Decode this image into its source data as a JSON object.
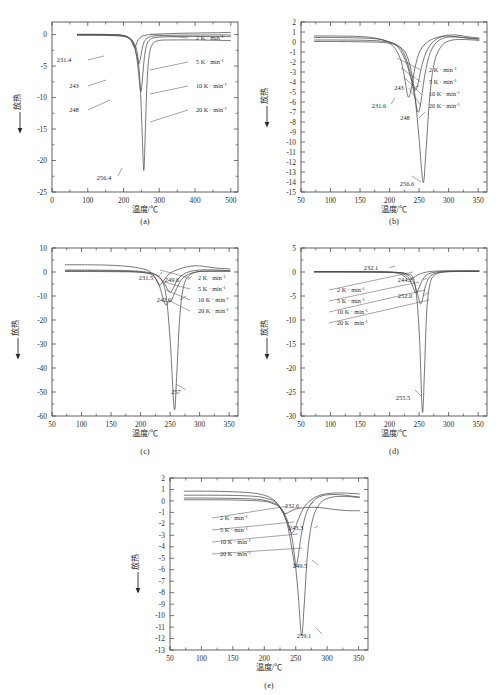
{
  "figure": {
    "axis_x_title": "温度/℃",
    "axis_y_title": "放热",
    "legend_entries": [
      "2 K · min",
      "5 K · min",
      "10 K · min",
      "20 K · min"
    ],
    "legend_exponent": "-1",
    "captions": [
      "(a)",
      "(b)",
      "(c)",
      "(d)",
      "(e)"
    ]
  },
  "chart_data": [
    {
      "type": "line",
      "panel": "(a)",
      "title": "",
      "xlabel": "温度/℃",
      "ylabel": "放热",
      "xlim": [
        0,
        520
      ],
      "ylim": [
        -25,
        2
      ],
      "xticks": [
        0,
        100,
        200,
        300,
        400,
        500
      ],
      "yticks": [
        0,
        -5,
        -10,
        -15,
        -20,
        -25
      ],
      "grid": false,
      "legend_position": "right-inside",
      "annotations": [
        "231.4",
        "243",
        "248",
        "256.4"
      ],
      "series": [
        {
          "name": "2 K · min-1",
          "peak_temperature": 231.4,
          "peak_value": -2.1,
          "x": [
            70,
            120,
            160,
            190,
            210,
            220,
            226,
            231.4,
            236,
            242,
            250,
            260,
            275,
            300,
            340,
            400,
            460,
            500
          ],
          "y": [
            0.05,
            0.05,
            0.02,
            -0.05,
            -0.35,
            -0.9,
            -1.6,
            -2.1,
            -1.5,
            -0.75,
            -0.3,
            -0.12,
            0.0,
            0.1,
            0.18,
            0.25,
            0.3,
            0.35
          ]
        },
        {
          "name": "5 K · min-1",
          "peak_temperature": 243,
          "peak_value": -4.6,
          "x": [
            70,
            120,
            160,
            195,
            215,
            228,
            236,
            240,
            243,
            247,
            252,
            258,
            268,
            285,
            320,
            380,
            450,
            500
          ],
          "y": [
            0.0,
            0.0,
            -0.02,
            -0.1,
            -0.5,
            -1.5,
            -3.2,
            -4.1,
            -4.6,
            -3.9,
            -2.3,
            -1.1,
            -0.5,
            -0.22,
            -0.12,
            -0.08,
            -0.05,
            -0.05
          ]
        },
        {
          "name": "10 K · min-1",
          "peak_temperature": 248,
          "peak_value": -9.1,
          "x": [
            70,
            120,
            160,
            200,
            220,
            232,
            240,
            244,
            248,
            252,
            257,
            263,
            272,
            290,
            330,
            390,
            450,
            500
          ],
          "y": [
            -0.05,
            -0.05,
            -0.08,
            -0.2,
            -0.7,
            -2.1,
            -5.0,
            -7.3,
            -9.1,
            -7.6,
            -4.3,
            -2.0,
            -0.9,
            -0.45,
            -0.35,
            -0.3,
            -0.3,
            -0.3
          ]
        },
        {
          "name": "20 K · min-1",
          "peak_temperature": 256.4,
          "peak_value": -21.5,
          "x": [
            70,
            120,
            165,
            205,
            225,
            238,
            246,
            251,
            256.4,
            260,
            265,
            271,
            280,
            298,
            335,
            395,
            455,
            500
          ],
          "y": [
            -0.1,
            -0.1,
            -0.15,
            -0.35,
            -1.0,
            -2.8,
            -7.5,
            -14.0,
            -21.5,
            -17.0,
            -8.5,
            -3.6,
            -1.6,
            -0.95,
            -0.85,
            -0.85,
            -0.9,
            -0.95
          ]
        }
      ]
    },
    {
      "type": "line",
      "panel": "(b)",
      "title": "",
      "xlabel": "温度/℃",
      "ylabel": "放热",
      "xlim": [
        50,
        365
      ],
      "ylim": [
        -15,
        2
      ],
      "xticks": [
        50,
        100,
        150,
        200,
        250,
        300,
        350
      ],
      "yticks": [
        2,
        1,
        0,
        -1,
        -2,
        -3,
        -4,
        -5,
        -6,
        -7,
        -8,
        -9,
        -10,
        -11,
        -12,
        -13,
        -14,
        -15
      ],
      "grid": false,
      "legend_position": "right-inside",
      "annotations": [
        "231.6",
        "243",
        "248",
        "256.6"
      ],
      "series": [
        {
          "name": "2 K · min-1",
          "peak_temperature": 231.6,
          "peak_value": -5.5,
          "x": [
            72,
            110,
            150,
            175,
            195,
            210,
            220,
            226,
            231.6,
            237,
            243,
            250,
            260,
            275,
            295,
            315,
            340,
            352
          ],
          "y": [
            0.6,
            0.6,
            0.55,
            0.4,
            0.05,
            -0.7,
            -2.0,
            -3.8,
            -5.5,
            -4.6,
            -2.6,
            -1.1,
            -0.2,
            0.35,
            0.6,
            0.5,
            0.35,
            0.3
          ]
        },
        {
          "name": "5 K · min-1",
          "peak_temperature": 243,
          "peak_value": -4.8,
          "x": [
            72,
            110,
            150,
            180,
            200,
            215,
            228,
            236,
            243,
            248,
            255,
            263,
            275,
            292,
            312,
            335,
            352
          ],
          "y": [
            0.45,
            0.45,
            0.4,
            0.3,
            0.0,
            -0.55,
            -2.0,
            -3.6,
            -4.8,
            -4.2,
            -2.3,
            -0.9,
            0.1,
            0.6,
            0.7,
            0.5,
            0.4
          ]
        },
        {
          "name": "10 K · min-1",
          "peak_temperature": 248,
          "peak_value": -7.0,
          "x": [
            72,
            110,
            150,
            185,
            205,
            220,
            232,
            241,
            248,
            253,
            260,
            268,
            280,
            296,
            316,
            338,
            352
          ],
          "y": [
            0.2,
            0.2,
            0.18,
            0.1,
            -0.1,
            -0.7,
            -2.4,
            -5.0,
            -7.0,
            -6.0,
            -3.2,
            -1.2,
            0.0,
            0.45,
            0.5,
            0.35,
            0.3
          ]
        },
        {
          "name": "20 K · min-1",
          "peak_temperature": 256.6,
          "peak_value": -14.0,
          "x": [
            72,
            110,
            150,
            190,
            210,
            228,
            240,
            249,
            256.6,
            261,
            268,
            276,
            288,
            303,
            322,
            342,
            352
          ],
          "y": [
            0.05,
            0.05,
            0.02,
            -0.05,
            -0.3,
            -1.2,
            -4.0,
            -9.0,
            -14.0,
            -11.5,
            -5.5,
            -2.0,
            -0.4,
            0.15,
            0.25,
            0.2,
            0.15
          ]
        }
      ]
    },
    {
      "type": "line",
      "panel": "(c)",
      "title": "",
      "xlabel": "温度/℃",
      "ylabel": "放热",
      "xlim": [
        50,
        365
      ],
      "ylim": [
        -60,
        10
      ],
      "xticks": [
        50,
        100,
        150,
        200,
        250,
        300,
        350
      ],
      "yticks": [
        10,
        0,
        -10,
        -20,
        -30,
        -40,
        -50,
        -60
      ],
      "grid": false,
      "legend_position": "right-inside",
      "annotations": [
        "231.5",
        "249.6",
        "242.6",
        "257"
      ],
      "series": [
        {
          "name": "2 K · min-1",
          "peak_temperature": 231.5,
          "peak_value": -5.5,
          "x": [
            72,
            110,
            150,
            180,
            200,
            215,
            224,
            231.5,
            238,
            245,
            252,
            262,
            276,
            292,
            308,
            330,
            352
          ],
          "y": [
            3.0,
            3.0,
            2.8,
            2.3,
            1.5,
            0.3,
            -2.2,
            -5.5,
            -4.0,
            -1.6,
            -0.2,
            0.9,
            2.0,
            2.6,
            2.3,
            1.6,
            1.3
          ]
        },
        {
          "name": "5 K · min-1",
          "peak_temperature": 249.6,
          "peak_value": -8.5,
          "x": [
            72,
            110,
            150,
            185,
            205,
            222,
            234,
            243,
            249.6,
            255,
            262,
            272,
            285,
            300,
            320,
            340,
            352
          ],
          "y": [
            0.8,
            0.8,
            0.7,
            0.5,
            0.1,
            -0.6,
            -2.6,
            -6.0,
            -8.5,
            -7.0,
            -3.5,
            -1.0,
            0.3,
            0.8,
            0.9,
            0.7,
            0.6
          ]
        },
        {
          "name": "10 K · min-1",
          "peak_temperature": 242.6,
          "peak_value": -13.8,
          "x": [
            72,
            110,
            150,
            185,
            205,
            220,
            230,
            237,
            242.6,
            247,
            252,
            259,
            270,
            285,
            305,
            330,
            352
          ],
          "y": [
            0.5,
            0.5,
            0.4,
            0.2,
            -0.2,
            -1.2,
            -4.5,
            -10.0,
            -13.8,
            -12.5,
            -12.0,
            -8.0,
            -3.0,
            -0.6,
            0.3,
            0.4,
            0.4
          ]
        },
        {
          "name": "20 K · min-1",
          "peak_temperature": 257,
          "peak_value": -57.0,
          "x": [
            72,
            110,
            150,
            190,
            212,
            230,
            242,
            250,
            257,
            261,
            266,
            272,
            281,
            296,
            318,
            340,
            352
          ],
          "y": [
            0.2,
            0.2,
            0.15,
            0.0,
            -0.5,
            -2.0,
            -8.0,
            -28.0,
            -57.0,
            -44.0,
            -20.0,
            -7.0,
            -1.8,
            0.1,
            0.3,
            0.3,
            0.3
          ]
        }
      ]
    },
    {
      "type": "line",
      "panel": "(d)",
      "title": "",
      "xlabel": "温度/℃",
      "ylabel": "放热",
      "xlim": [
        50,
        365
      ],
      "ylim": [
        -30,
        5
      ],
      "xticks": [
        50,
        100,
        150,
        200,
        250,
        300,
        350
      ],
      "yticks": [
        5,
        0,
        -5,
        -10,
        -15,
        -20,
        -25,
        -30
      ],
      "grid": false,
      "legend_position": "left-inside",
      "annotations": [
        "232.1",
        "244.2",
        "252.0",
        "255.5"
      ],
      "series": [
        {
          "name": "2 K · min-1",
          "peak_temperature": 232.1,
          "peak_value": -1.6,
          "x": [
            72,
            120,
            160,
            195,
            215,
            225,
            232.1,
            240,
            248,
            256,
            266,
            280,
            300,
            325,
            352
          ],
          "y": [
            0.1,
            0.1,
            0.08,
            0.0,
            -0.3,
            -0.9,
            -1.6,
            -1.2,
            -0.6,
            -0.2,
            0.05,
            0.2,
            0.25,
            0.25,
            0.25
          ]
        },
        {
          "name": "5 K · min-1",
          "peak_temperature": 244.2,
          "peak_value": -4.4,
          "x": [
            72,
            120,
            165,
            200,
            220,
            232,
            240,
            244.2,
            249,
            255,
            262,
            272,
            288,
            312,
            352
          ],
          "y": [
            0.05,
            0.05,
            0.05,
            -0.02,
            -0.25,
            -1.2,
            -3.2,
            -4.4,
            -3.6,
            -1.8,
            -0.7,
            -0.15,
            0.1,
            0.2,
            0.2
          ]
        },
        {
          "name": "10 K · min-1",
          "peak_temperature": 252.0,
          "peak_value": -6.6,
          "x": [
            72,
            120,
            165,
            205,
            225,
            238,
            246,
            252,
            256,
            261,
            268,
            278,
            294,
            318,
            352
          ],
          "y": [
            0.02,
            0.02,
            0.0,
            -0.05,
            -0.3,
            -1.4,
            -4.0,
            -6.6,
            -5.6,
            -2.8,
            -1.0,
            -0.25,
            0.05,
            0.15,
            0.15
          ]
        },
        {
          "name": "20 K · min-1",
          "peak_temperature": 255.5,
          "peak_value": -29.0,
          "x": [
            72,
            120,
            165,
            208,
            228,
            242,
            250,
            255.5,
            259,
            263,
            269,
            278,
            294,
            320,
            352
          ],
          "y": [
            0.0,
            0.0,
            -0.02,
            -0.08,
            -0.35,
            -2.0,
            -12.0,
            -29.0,
            -21.0,
            -8.0,
            -2.2,
            -0.5,
            0.0,
            0.1,
            0.1
          ]
        }
      ]
    },
    {
      "type": "line",
      "panel": "(e)",
      "title": "",
      "xlabel": "温度/℃",
      "ylabel": "放热",
      "xlim": [
        50,
        365
      ],
      "ylim": [
        -13,
        2
      ],
      "xticks": [
        50,
        100,
        150,
        200,
        250,
        300,
        350
      ],
      "yticks": [
        2,
        1,
        0,
        -1,
        -2,
        -3,
        -4,
        -5,
        -6,
        -7,
        -8,
        -9,
        -10,
        -11,
        -12,
        -13
      ],
      "grid": false,
      "legend_position": "left-inside",
      "annotations": [
        "232.6",
        "243.3",
        "249.5",
        "259.1"
      ],
      "series": [
        {
          "name": "2 K · min-1",
          "peak_temperature": 232.6,
          "peak_value": -1.1,
          "x": [
            72,
            110,
            150,
            180,
            200,
            215,
            226,
            232.6,
            240,
            250,
            262,
            276,
            292,
            312,
            335,
            352
          ],
          "y": [
            0.85,
            0.85,
            0.8,
            0.7,
            0.5,
            0.1,
            -0.6,
            -1.1,
            -0.95,
            -0.7,
            -0.6,
            -0.55,
            -0.6,
            -0.75,
            -0.85,
            -0.85
          ]
        },
        {
          "name": "5 K · min-1",
          "peak_temperature": 243.3,
          "peak_value": -2.8,
          "x": [
            72,
            110,
            150,
            185,
            205,
            220,
            232,
            240,
            243.3,
            248,
            255,
            264,
            276,
            292,
            315,
            340,
            352
          ],
          "y": [
            0.5,
            0.5,
            0.48,
            0.4,
            0.2,
            -0.2,
            -1.3,
            -2.4,
            -2.8,
            -2.5,
            -1.5,
            -0.5,
            0.15,
            0.55,
            0.7,
            0.65,
            0.6
          ]
        },
        {
          "name": "10 K · min-1",
          "peak_temperature": 249.5,
          "peak_value": -5.8,
          "x": [
            72,
            110,
            150,
            188,
            208,
            224,
            236,
            244,
            249.5,
            254,
            260,
            268,
            280,
            296,
            318,
            342,
            352
          ],
          "y": [
            0.25,
            0.25,
            0.22,
            0.15,
            -0.05,
            -0.5,
            -1.9,
            -4.2,
            -5.8,
            -4.8,
            -2.6,
            -0.9,
            0.1,
            0.5,
            0.55,
            0.4,
            0.35
          ]
        },
        {
          "name": "20 K · min-1",
          "peak_temperature": 259.1,
          "peak_value": -11.7,
          "x": [
            72,
            110,
            150,
            192,
            212,
            230,
            244,
            253,
            259.1,
            263,
            269,
            277,
            289,
            305,
            328,
            348,
            352
          ],
          "y": [
            0.1,
            0.1,
            0.08,
            0.0,
            -0.2,
            -0.9,
            -3.2,
            -7.5,
            -11.7,
            -9.5,
            -4.5,
            -1.6,
            -0.2,
            0.3,
            0.4,
            0.3,
            0.28
          ]
        }
      ]
    }
  ]
}
